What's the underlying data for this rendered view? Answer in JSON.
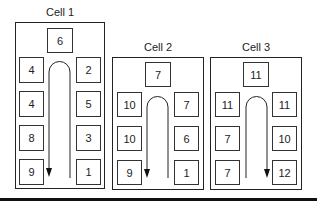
{
  "cells": [
    {
      "label": "Cell 1",
      "top_station": "6",
      "left_stations": [
        "4",
        "4",
        "8",
        "9"
      ],
      "right_stations": [
        "2",
        "5",
        "3",
        "1"
      ],
      "flow_direction": "up-right-then-down-left"
    },
    {
      "label": "Cell 2",
      "top_station": "7",
      "left_stations": [
        "10",
        "10",
        "9"
      ],
      "right_stations": [
        "7",
        "6",
        "1"
      ],
      "flow_direction": "up-right-then-down-left"
    },
    {
      "label": "Cell 3",
      "top_station": "11",
      "left_stations": [
        "11",
        "7",
        "7"
      ],
      "right_stations": [
        "11",
        "10",
        "12"
      ],
      "flow_direction": "up-left-then-down-right"
    }
  ],
  "colors": {
    "line": "#222222",
    "bottom_bar": "#111111",
    "background": "#ffffff"
  }
}
